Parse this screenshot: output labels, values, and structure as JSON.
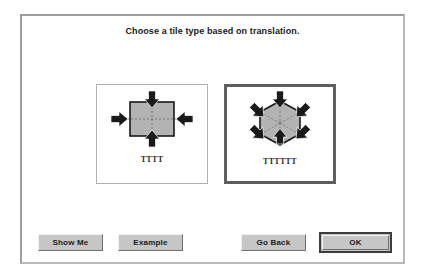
{
  "dialog": {
    "title": "Choose a tile type based on translation."
  },
  "choices": [
    {
      "id": "square-tile",
      "label": "TTTT",
      "shape": "square",
      "arrow_count": 4,
      "selected": false
    },
    {
      "id": "hexagon-tile",
      "label": "TTTTTT",
      "shape": "hexagon",
      "arrow_count": 6,
      "selected": true
    }
  ],
  "buttons": {
    "show_me": "Show Me",
    "example": "Example",
    "go_back": "Go Back",
    "ok": "OK"
  },
  "colors": {
    "tile_fill": "#b3b3b3",
    "tile_stroke": "#1a1a1a",
    "arrow": "#1a1a1a",
    "selection_border": "#5e5e5e",
    "button_face": "#c6c6c6",
    "dialog_bg": "#ffffff"
  }
}
